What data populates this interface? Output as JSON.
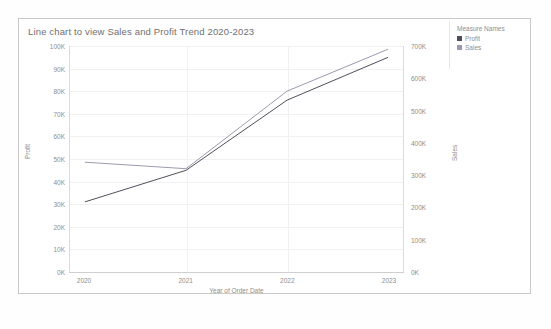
{
  "chart_data": {
    "type": "line",
    "title": "Line chart to view Sales and Profit Trend 2020-2023",
    "xlabel": "Year of Order Date",
    "categories": [
      "2020",
      "2021",
      "2022",
      "2023"
    ],
    "grid": true,
    "legend_position": "right",
    "legend_title": "Measure Names",
    "series": [
      {
        "name": "Profit",
        "axis": "left",
        "color": "#4e4e5a",
        "values": [
          31000,
          45000,
          76000,
          95000
        ],
        "ylabel": "Profit",
        "ylim": [
          0,
          100000
        ],
        "yticks": [
          "0K",
          "10K",
          "20K",
          "30K",
          "40K",
          "50K",
          "60K",
          "70K",
          "80K",
          "90K",
          "100K"
        ]
      },
      {
        "name": "Sales",
        "axis": "right",
        "color": "#9b9bb0",
        "values": [
          340000,
          320000,
          560000,
          690000
        ],
        "ylabel": "Sales",
        "ylim": [
          0,
          700000
        ],
        "yticks": [
          "0K",
          "100K",
          "200K",
          "300K",
          "400K",
          "500K",
          "600K",
          "700K"
        ]
      }
    ]
  },
  "legend": {
    "title": "Measure Names",
    "items": [
      {
        "label": "Profit",
        "color": "#4e4e5a"
      },
      {
        "label": "Sales",
        "color": "#9b9bb0"
      }
    ]
  },
  "axes": {
    "left_title": "Profit",
    "right_title": "Sales",
    "x_title": "Year of Order Date",
    "left_ticks": [
      "100K",
      "90K",
      "80K",
      "70K",
      "60K",
      "50K",
      "40K",
      "30K",
      "20K",
      "10K",
      "0K"
    ],
    "right_ticks": [
      "700K",
      "600K",
      "500K",
      "400K",
      "300K",
      "200K",
      "100K",
      "0K"
    ],
    "x_ticks": [
      "2020",
      "2021",
      "2022",
      "2023"
    ]
  }
}
